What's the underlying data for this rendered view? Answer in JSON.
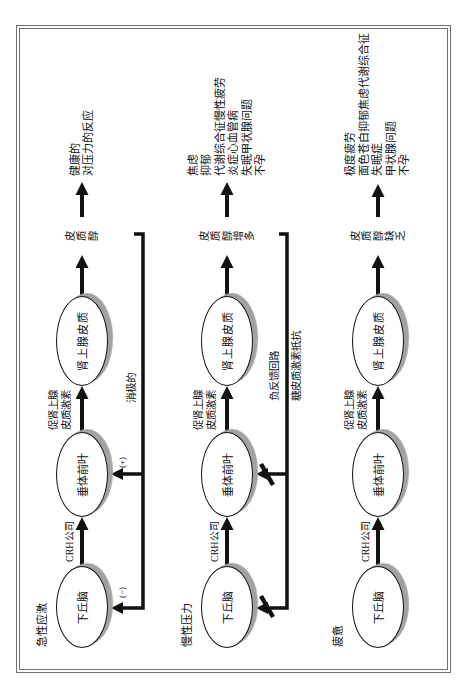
{
  "figure": {
    "rows": [
      {
        "label": "急性应激",
        "nodes": {
          "hypothalamus": "下丘脑",
          "pituitary": "垂体前叶",
          "adrenal": "肾上腺皮质"
        },
        "edge_labels": {
          "crh": "CRH公司",
          "acth_line1": "促肾上腺",
          "acth_line2": "皮质激素"
        },
        "cortisol": "皮质醇",
        "outcome": [
          "健康的",
          "对压力的反应"
        ],
        "feedback": {
          "type": "negative",
          "label": "消极的",
          "pituitary_sign": "(+)",
          "hypothalamus_sign": "(−)"
        }
      },
      {
        "label": "慢性压力",
        "nodes": {
          "hypothalamus": "下丘脑",
          "pituitary": "垂体前叶",
          "adrenal": "肾上腺皮质"
        },
        "edge_labels": {
          "crh": "CRH公司",
          "acth_line1": "促肾上腺",
          "acth_line2": "皮质激素"
        },
        "cortisol": "皮质醇增多",
        "outcome": [
          "焦虑",
          "抑郁",
          "代谢综合征慢性疲劳",
          "炎症心血管病",
          "失眠甲状腺问题",
          "不孕"
        ],
        "feedback": {
          "type": "blocked",
          "label_above": "负反馈回路",
          "label_below": "糖皮质激素抵抗"
        }
      },
      {
        "label": "疲惫",
        "nodes": {
          "hypothalamus": "下丘脑",
          "pituitary": "垂体前叶",
          "adrenal": "肾上腺皮质"
        },
        "edge_labels": {
          "crh": "CRH公司",
          "acth_line1": "促肾上腺",
          "acth_line2": "皮质激素"
        },
        "cortisol": "皮质醇缺乏",
        "outcome": [
          "极度疲劳",
          "面色苍白抑郁焦虑代谢综合征",
          "失眠症",
          "甲状腺问题",
          "不孕"
        ]
      }
    ],
    "colors": {
      "ink": "#111111",
      "shadow": "#a2a2a2",
      "frame": "#707070"
    }
  }
}
